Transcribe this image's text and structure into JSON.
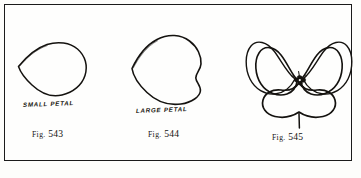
{
  "plate": {
    "kind": "book-illustration-plate",
    "background_color": "#fdfdfb",
    "ink_color": "#14120f",
    "border_color": "#1b1b1b"
  },
  "figures": [
    {
      "id": "fig-543",
      "caption_prefix": "Fig.",
      "caption_number": "543",
      "drawing_label": "SMALL PETAL",
      "subject": "small-petal-outline"
    },
    {
      "id": "fig-544",
      "caption_prefix": "Fig.",
      "caption_number": "544",
      "drawing_label": "LARGE PETAL",
      "subject": "large-petal-outline"
    },
    {
      "id": "fig-545",
      "caption_prefix": "Fig.",
      "caption_number": "545",
      "drawing_label": "",
      "subject": "assembled-pansy-flower"
    }
  ]
}
